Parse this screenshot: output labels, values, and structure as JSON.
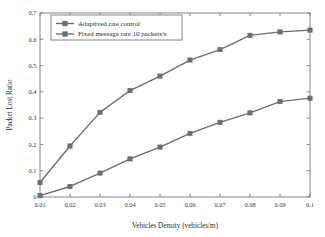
{
  "chart_data": {
    "type": "line",
    "title": "",
    "xlabel": "Vehicles Density (vehicles/m)",
    "ylabel": "Packet Lost Ratio",
    "xlim": [
      0.01,
      0.1
    ],
    "ylim": [
      0,
      0.7
    ],
    "grid": false,
    "legend_position": "upper-left-inside",
    "x": [
      0.01,
      0.02,
      0.03,
      0.04,
      0.05,
      0.06,
      0.07,
      0.08,
      0.09,
      0.1
    ],
    "xticklabels": [
      "0.01",
      "0.02",
      "0.03",
      "0.04",
      "0.05",
      "0.06",
      "0.07",
      "0.08",
      "0.09",
      "0.1"
    ],
    "yticklabels": [
      "0",
      "0.1",
      "0.2",
      "0.3",
      "0.4",
      "0.5",
      "0.6",
      "0.7"
    ],
    "yticks": [
      0,
      0.1,
      0.2,
      0.3,
      0.4,
      0.5,
      0.6,
      0.7
    ],
    "series": [
      {
        "name": "Adaptived rate control",
        "color": "#6e6e6e",
        "marker": "square",
        "values": [
          0.005,
          0.04,
          0.091,
          0.145,
          0.19,
          0.242,
          0.284,
          0.32,
          0.363,
          0.376
        ]
      },
      {
        "name": "Fixed message rate 10 packets/s",
        "color": "#6e6e6e",
        "marker": "square",
        "values": [
          0.055,
          0.194,
          0.322,
          0.405,
          0.46,
          0.521,
          0.561,
          0.615,
          0.628,
          0.635
        ]
      }
    ]
  },
  "legend": {
    "entries": [
      "Adaptived rate control",
      "Fixed message rate 10 packets/s"
    ]
  },
  "colors": {
    "line": "#6e6e6e",
    "axis": "#7a7a7a",
    "text": "#2b2b2b",
    "background": "#ffffff"
  }
}
